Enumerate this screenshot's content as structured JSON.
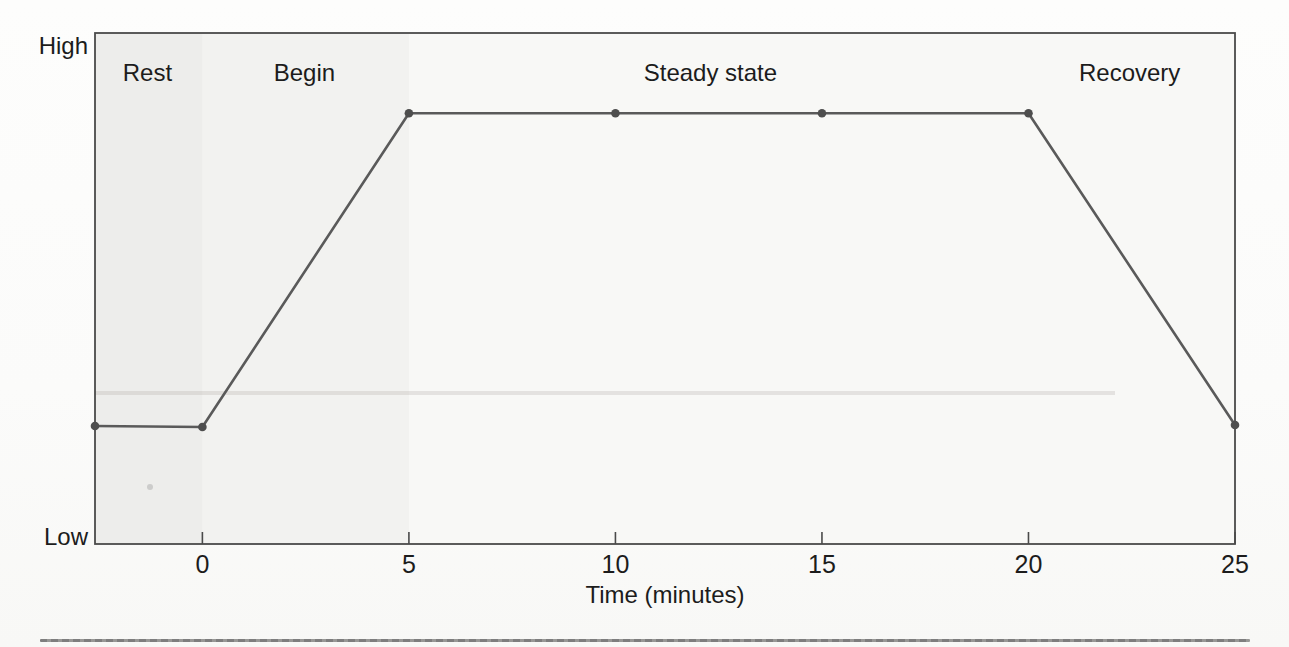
{
  "chart_data": {
    "type": "line",
    "title": "",
    "xlabel": "Time (minutes)",
    "ylabel": "",
    "x_axis": {
      "range": [
        -2.6,
        25
      ],
      "ticks": [
        0,
        5,
        10,
        15,
        20,
        25
      ],
      "tick_labels": [
        "0",
        "5",
        "10",
        "15",
        "20",
        "25"
      ]
    },
    "y_axis": {
      "type": "qualitative",
      "min_label": "Low",
      "max_label": "High",
      "range": [
        0,
        1
      ]
    },
    "series": [
      {
        "name": "exercise-intensity",
        "x": [
          -2.6,
          0,
          5,
          10,
          15,
          20,
          25
        ],
        "y": [
          0.231,
          0.229,
          0.843,
          0.843,
          0.843,
          0.843,
          0.233
        ],
        "y_qualitative": [
          "low",
          "low",
          "high",
          "high",
          "high",
          "high",
          "low"
        ],
        "markers": true
      }
    ],
    "annotations": [
      {
        "label": "Rest",
        "x": -1.33,
        "y": 0.922
      },
      {
        "label": "Begin",
        "x": 2.47,
        "y": 0.922
      },
      {
        "label": "Steady state",
        "x": 12.3,
        "y": 0.922
      },
      {
        "label": "Recovery",
        "x": 22.45,
        "y": 0.922
      }
    ],
    "grid": false,
    "legend": false,
    "line_color": "#5a5a5a",
    "marker_color": "#4e4e4e",
    "axis_color": "#4a4a4a",
    "text_color": "#1c1c1c",
    "plot_bg_color": "#f8f8f6"
  }
}
